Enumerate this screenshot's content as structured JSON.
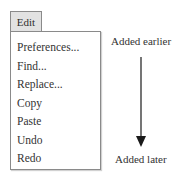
{
  "menu": {
    "title": "Edit",
    "items": [
      {
        "label": "Preferences..."
      },
      {
        "label": "Find..."
      },
      {
        "label": "Replace..."
      },
      {
        "label": "Copy"
      },
      {
        "label": "Paste"
      },
      {
        "label": "Undo"
      },
      {
        "label": "Redo"
      }
    ]
  },
  "annotation": {
    "top_label": "Added earlier",
    "bottom_label": "Added later",
    "arrow_direction": "down",
    "arrow_color": "#1a1a1a"
  },
  "colors": {
    "tab_background": "#e2e2e2",
    "border": "#8a8a8a",
    "text": "#333333"
  }
}
